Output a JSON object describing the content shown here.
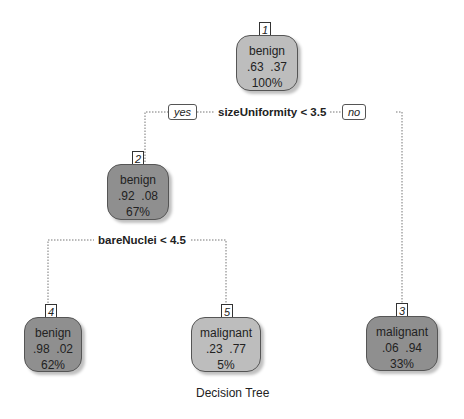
{
  "title": "Decision Tree",
  "colors": {
    "node_light": "#bdbdbd",
    "node_dark": "#8f8f8f",
    "edge": "#777777"
  },
  "tree": {
    "root": {
      "id": "1",
      "class": "benign",
      "probs": ".63  .37",
      "pct": "100%",
      "split": "sizeUniformity < 3.5",
      "yes_label": "yes",
      "no_label": "no"
    },
    "node2": {
      "id": "2",
      "class": "benign",
      "probs": ".92  .08",
      "pct": "67%",
      "split": "bareNuclei < 4.5"
    },
    "node3": {
      "id": "3",
      "class": "malignant",
      "probs": ".06  .94",
      "pct": "33%"
    },
    "node4": {
      "id": "4",
      "class": "benign",
      "probs": ".98  .02",
      "pct": "62%"
    },
    "node5": {
      "id": "5",
      "class": "malignant",
      "probs": ".23  .77",
      "pct": "5%"
    }
  }
}
